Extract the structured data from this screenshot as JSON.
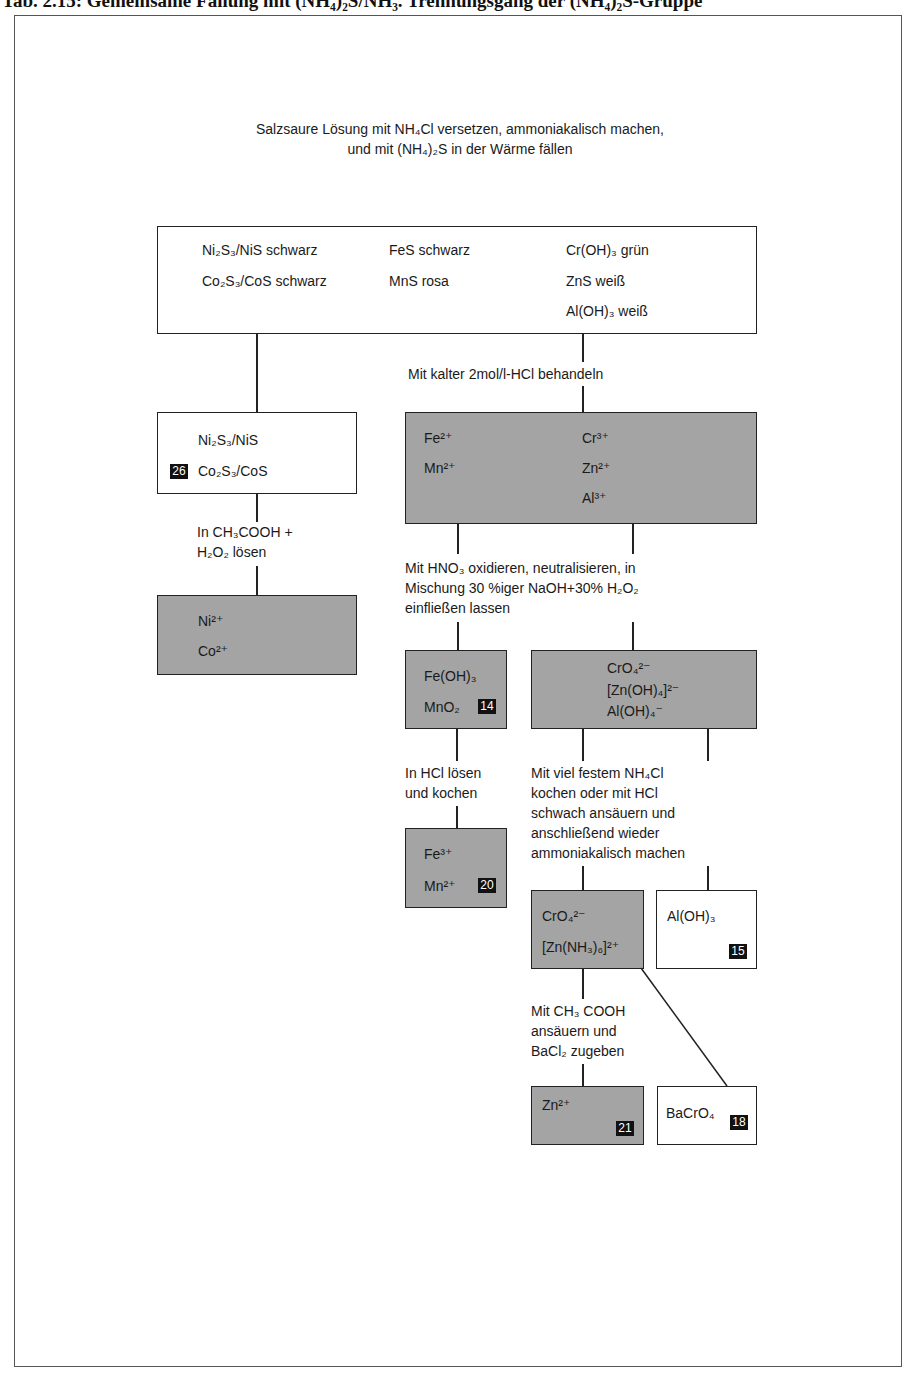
{
  "heading": "Tab. 2.15: Gemeinsame Fällung mit (NH₄)₂S/NH₃. Trennungsgang der (NH₄)₂S-Gruppe",
  "intro": {
    "line1": "Salzsaure Lösung mit NH₄Cl versetzen, ammoniakalisch machen,",
    "line2": "und mit (NH₄)₂S in der Wärme fällen"
  },
  "precipitate_box": {
    "col1": [
      "Ni₂S₃/NiS schwarz",
      "Co₂S₃/CoS schwarz"
    ],
    "col2": [
      "FeS schwarz",
      "MnS rosa"
    ],
    "col3": [
      "Cr(OH)₃ grün",
      "ZnS weiß",
      "Al(OH)₃ weiß"
    ]
  },
  "step_hcl": "Mit kalter 2mol/l-HCl behandeln",
  "nico_sulfide_box": {
    "lines": [
      "Ni₂S₃/NiS",
      "Co₂S₃/CoS"
    ],
    "badge": "26"
  },
  "dissolved_box": {
    "col1": [
      "Fe²⁺",
      "Mn²⁺"
    ],
    "col2": [
      "Cr³⁺",
      "Zn²⁺",
      "Al³⁺"
    ]
  },
  "step_acetic": [
    "In CH₃COOH +",
    "H₂O₂ lösen"
  ],
  "nico_ion_box": {
    "lines": [
      "Ni²⁺",
      "Co²⁺"
    ]
  },
  "step_hno3": [
    "Mit HNO₃ oxidieren, neutralisieren, in",
    "Mischung 30 %iger NaOH+30% H₂O₂",
    "einfließen lassen"
  ],
  "femn_hydroxide_box": {
    "lines": [
      "Fe(OH)₃",
      "MnO₂"
    ],
    "badge": "14"
  },
  "chromate_box": {
    "lines": [
      "CrO₄²⁻",
      "[Zn(OH)₄]²⁻",
      "Al(OH)₄⁻"
    ]
  },
  "step_hcl_boil": [
    "In HCl lösen",
    "und kochen"
  ],
  "step_nh4cl": [
    "Mit viel festem NH₄Cl",
    "kochen oder mit HCl",
    "schwach ansäuern und",
    "anschließend wieder",
    "ammoniakalisch machen"
  ],
  "femn_ion_box": {
    "lines": [
      "Fe³⁺",
      "Mn²⁺"
    ],
    "badge": "20"
  },
  "chromate_zinc_box": {
    "lines": [
      "CrO₄²⁻",
      "[Zn(NH₃)₆]²⁺"
    ]
  },
  "aluminium_box": {
    "lines": [
      "Al(OH)₃"
    ],
    "badge": "15"
  },
  "step_bacl2": [
    "Mit CH₃ COOH",
    "ansäuern und",
    "BaCl₂ zugeben"
  ],
  "zinc_box": {
    "lines": [
      "Zn²⁺"
    ],
    "badge": "21"
  },
  "barium_chromate_box": {
    "lines": [
      "BaCrO₄"
    ],
    "badge": "18"
  },
  "colors": {
    "gray_fill": "#a4a4a4",
    "line": "#222222",
    "badge": "#111111"
  }
}
